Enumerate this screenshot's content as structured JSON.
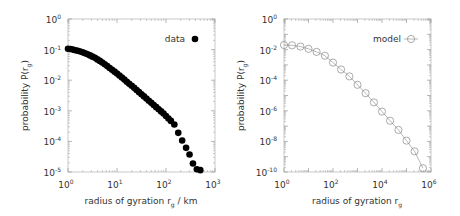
{
  "chart_data": [
    {
      "type": "scatter",
      "panel": "left",
      "xscale": "log",
      "yscale": "log",
      "xlabel": "radius of gyration r_g / km",
      "ylabel": "probability P(r_g)",
      "xlim": [
        1,
        1000
      ],
      "ylim": [
        1e-05,
        1
      ],
      "xticks": [
        {
          "base": "10",
          "exp": "0",
          "value": 1
        },
        {
          "base": "10",
          "exp": "1",
          "value": 10
        },
        {
          "base": "10",
          "exp": "2",
          "value": 100
        },
        {
          "base": "10",
          "exp": "3",
          "value": 1000
        }
      ],
      "yticks": [
        {
          "base": "10",
          "exp": "0",
          "value": 1
        },
        {
          "base": "10",
          "exp": "-1",
          "value": 0.1
        },
        {
          "base": "10",
          "exp": "-2",
          "value": 0.01
        },
        {
          "base": "10",
          "exp": "-3",
          "value": 0.001
        },
        {
          "base": "10",
          "exp": "-4",
          "value": 0.0001
        },
        {
          "base": "10",
          "exp": "-5",
          "value": 1e-05
        }
      ],
      "legend": {
        "label": "data",
        "marker": "filled-circle",
        "position": "top-right"
      },
      "marker_color": "#000000",
      "series": [
        {
          "name": "data",
          "log10_x": [
            0.0,
            0.05,
            0.1,
            0.15,
            0.2,
            0.25,
            0.3,
            0.35,
            0.4,
            0.45,
            0.5,
            0.55,
            0.6,
            0.65,
            0.7,
            0.75,
            0.8,
            0.85,
            0.9,
            0.95,
            1.0,
            1.05,
            1.1,
            1.15,
            1.2,
            1.25,
            1.3,
            1.35,
            1.4,
            1.45,
            1.5,
            1.55,
            1.6,
            1.65,
            1.7,
            1.75,
            1.8,
            1.85,
            1.9,
            1.95,
            2.0,
            2.05,
            2.1,
            2.17,
            2.25,
            2.33,
            2.41,
            2.48,
            2.55,
            2.63,
            2.7
          ],
          "log10_y": [
            -0.97,
            -0.98,
            -1.0,
            -1.02,
            -1.04,
            -1.06,
            -1.09,
            -1.12,
            -1.15,
            -1.19,
            -1.23,
            -1.27,
            -1.32,
            -1.37,
            -1.42,
            -1.48,
            -1.54,
            -1.6,
            -1.66,
            -1.72,
            -1.78,
            -1.85,
            -1.91,
            -1.98,
            -2.05,
            -2.12,
            -2.18,
            -2.25,
            -2.32,
            -2.39,
            -2.46,
            -2.53,
            -2.6,
            -2.67,
            -2.74,
            -2.81,
            -2.88,
            -2.95,
            -3.02,
            -3.09,
            -3.17,
            -3.25,
            -3.33,
            -3.45,
            -3.72,
            -3.97,
            -4.21,
            -4.43,
            -4.72,
            -4.91,
            -4.94
          ]
        }
      ]
    },
    {
      "type": "line",
      "panel": "right",
      "xscale": "log",
      "yscale": "log",
      "xlabel": "radius of gyration r_g",
      "ylabel": "probability P(r_g)",
      "xlim": [
        1,
        1000000
      ],
      "ylim": [
        1e-10,
        1
      ],
      "xticks": [
        {
          "base": "10",
          "exp": "0",
          "value": 1
        },
        {
          "base": "10",
          "exp": "2",
          "value": 100
        },
        {
          "base": "10",
          "exp": "4",
          "value": 10000
        },
        {
          "base": "10",
          "exp": "6",
          "value": 1000000
        }
      ],
      "yticks": [
        {
          "base": "10",
          "exp": "0",
          "value": 1
        },
        {
          "base": "10",
          "exp": "-2",
          "value": 0.01
        },
        {
          "base": "10",
          "exp": "-4",
          "value": 0.0001
        },
        {
          "base": "10",
          "exp": "-6",
          "value": 1e-06
        },
        {
          "base": "10",
          "exp": "-8",
          "value": 1e-08
        },
        {
          "base": "10",
          "exp": "-10",
          "value": 1e-10
        }
      ],
      "legend": {
        "label": "model",
        "marker": "open-circle-with-line",
        "position": "top-right"
      },
      "marker_color": "#888888",
      "series": [
        {
          "name": "model",
          "log10_x": [
            0.0,
            0.33,
            0.67,
            1.0,
            1.33,
            1.67,
            2.0,
            2.33,
            2.67,
            3.0,
            3.33,
            3.67,
            4.0,
            4.33,
            4.67,
            5.0,
            5.33,
            5.67
          ],
          "log10_y": [
            -1.7,
            -1.72,
            -1.8,
            -1.95,
            -2.15,
            -2.4,
            -2.85,
            -3.3,
            -3.75,
            -4.3,
            -4.85,
            -5.45,
            -6.05,
            -6.65,
            -7.25,
            -7.95,
            -8.65,
            -9.75
          ]
        }
      ]
    }
  ]
}
